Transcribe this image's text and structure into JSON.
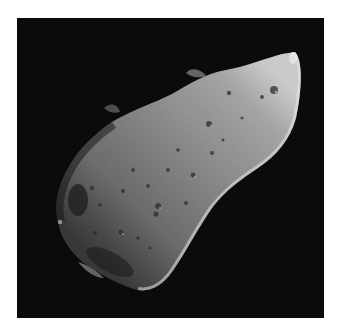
{
  "image": {
    "subject": "asteroid",
    "alt": "Grayscale photograph of an elongated, cratered asteroid against a black space background",
    "background_color": "#0b0b0b",
    "border_color": "#ffffff",
    "surface_colors": {
      "lit": "#d8d8d8",
      "mid": "#8a8a8a",
      "shadow": "#2a2a2a"
    }
  }
}
